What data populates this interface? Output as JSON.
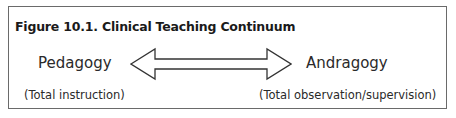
{
  "figure": {
    "title": "Figure 10.1. Clinical Teaching Continuum",
    "left": {
      "label": "Pedagogy",
      "sublabel": "(Total instruction)"
    },
    "right": {
      "label": "Andragogy",
      "sublabel": "(Total observation/supervision)"
    },
    "connector": "double-headed-arrow"
  },
  "colors": {
    "border": "#6a6a6a",
    "text": "#2a2a2a",
    "arrow_stroke": "#333333"
  }
}
